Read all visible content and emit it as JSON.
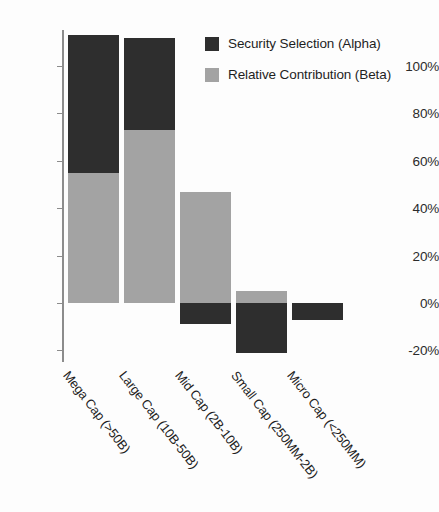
{
  "chart_data": {
    "type": "bar",
    "title": "",
    "subtitle": "",
    "xlabel": "",
    "ylabel": "",
    "stacked": true,
    "grid": false,
    "legend_position": "top-right",
    "ylim": [
      -25,
      115
    ],
    "yticks": [
      -20,
      0,
      20,
      40,
      60,
      80,
      100
    ],
    "ytick_labels": [
      "-20%",
      "0%",
      "20%",
      "40%",
      "60%",
      "80%",
      "100%"
    ],
    "categories": [
      "Mega Cap (>50B)",
      "Large Cap (10B-50B)",
      "Mid Cap (2B-10B)",
      "Small Cap (250MM-2B)",
      "Micro Cap (<250MM)"
    ],
    "series": [
      {
        "name": "Relative Contribution (Beta)",
        "color": "#a3a3a3",
        "values": [
          55,
          73,
          47,
          5,
          0
        ]
      },
      {
        "name": "Security Selection (Alpha)",
        "color": "#2e2e2e",
        "values": [
          58,
          39,
          -9,
          -21,
          -7
        ]
      }
    ],
    "totals": [
      113,
      112,
      38,
      -16,
      -7
    ]
  },
  "legend": {
    "items": [
      {
        "label": "Security Selection (Alpha)",
        "color": "#2e2e2e",
        "key": "alpha"
      },
      {
        "label": "Relative Contribution (Beta)",
        "color": "#a3a3a3",
        "key": "beta"
      }
    ]
  },
  "axis": {
    "tick_labels": [
      "100%",
      "80%",
      "60%",
      "40%",
      "20%",
      "0%",
      "-20%"
    ]
  },
  "colors": {
    "alpha": "#2e2e2e",
    "beta": "#a3a3a3",
    "axis": "#8c8c8c",
    "text": "#1f1f1f",
    "background": "#fdfdfd"
  }
}
